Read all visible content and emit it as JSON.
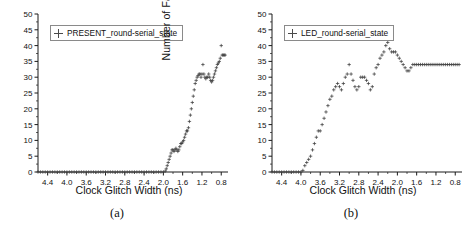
{
  "figure": {
    "panels": [
      {
        "id": "panel-a",
        "caption": "(a)",
        "legend_label": "PRESENT_round-serial_state",
        "legend_marker": "plus-icon"
      },
      {
        "id": "panel-b",
        "caption": "(b)",
        "legend_label": "LED_round-serial_state",
        "legend_marker": "plus-icon"
      }
    ]
  },
  "chart_data": [
    {
      "type": "scatter",
      "title": "",
      "xlabel": "Clock Glitch Width (ns)",
      "ylabel": "Number of Faulty Bits",
      "legend": [
        "PRESENT_round-serial_state"
      ],
      "legend_position": "top-left",
      "grid": false,
      "xlim": [
        4.6,
        0.66
      ],
      "ylim": [
        0,
        50
      ],
      "x_reversed": true,
      "xticks": [
        4.4,
        4.0,
        3.6,
        3.2,
        2.8,
        2.4,
        2.0,
        1.6,
        1.2,
        0.8
      ],
      "xtick_labels": [
        "4.4",
        "4.0",
        "3.6",
        "3.2",
        "2.8",
        "2.4",
        "2.0",
        "1.6",
        "1.2",
        "0.8"
      ],
      "yticks": [
        0,
        5,
        10,
        15,
        20,
        25,
        30,
        35,
        40,
        45,
        50
      ],
      "ytick_labels": [
        "0",
        "5",
        "10",
        "15",
        "20",
        "25",
        "30",
        "35",
        "40",
        "45",
        "50"
      ],
      "marker": "+",
      "color": "#3c3c3c",
      "x": [
        4.6,
        4.55,
        4.5,
        4.45,
        4.4,
        4.35,
        4.3,
        4.25,
        4.2,
        4.15,
        4.1,
        4.05,
        4.0,
        3.95,
        3.9,
        3.85,
        3.8,
        3.75,
        3.7,
        3.65,
        3.6,
        3.55,
        3.5,
        3.45,
        3.4,
        3.35,
        3.3,
        3.25,
        3.2,
        3.15,
        3.1,
        3.05,
        3.0,
        2.95,
        2.9,
        2.85,
        2.8,
        2.75,
        2.7,
        2.65,
        2.6,
        2.55,
        2.5,
        2.45,
        2.4,
        2.35,
        2.3,
        2.25,
        2.2,
        2.15,
        2.1,
        2.05,
        2.0,
        1.96,
        1.94,
        1.92,
        1.9,
        1.88,
        1.86,
        1.84,
        1.82,
        1.8,
        1.78,
        1.76,
        1.74,
        1.72,
        1.7,
        1.68,
        1.66,
        1.64,
        1.62,
        1.6,
        1.58,
        1.56,
        1.54,
        1.52,
        1.5,
        1.48,
        1.46,
        1.44,
        1.42,
        1.4,
        1.38,
        1.36,
        1.34,
        1.32,
        1.3,
        1.28,
        1.26,
        1.24,
        1.22,
        1.2,
        1.18,
        1.16,
        1.14,
        1.12,
        1.1,
        1.08,
        1.06,
        1.04,
        1.02,
        1.0,
        0.98,
        0.96,
        0.94,
        0.92,
        0.9,
        0.88,
        0.86,
        0.84,
        0.82,
        0.8,
        0.78,
        0.76,
        0.74,
        0.72
      ],
      "y": [
        0,
        0,
        0,
        0,
        0,
        0,
        0,
        0,
        0,
        0,
        0,
        0,
        0,
        0,
        0,
        0,
        0,
        0,
        0,
        0,
        0,
        0,
        0,
        0,
        0,
        0,
        0,
        0,
        0,
        0,
        0,
        0,
        0,
        0,
        0,
        0,
        0,
        0,
        0,
        0,
        0,
        0,
        0,
        0,
        0,
        0,
        0,
        0,
        0,
        0,
        0,
        0,
        0,
        0.3,
        1,
        2,
        3,
        4,
        5,
        6,
        7,
        7,
        6.5,
        7,
        7.5,
        7,
        6.5,
        7,
        8,
        9,
        9,
        9.5,
        10,
        11,
        12,
        13,
        13,
        14,
        16,
        18,
        20,
        22,
        24,
        26,
        28,
        29,
        30,
        30.5,
        31,
        31,
        30,
        31,
        34,
        31,
        30,
        29.5,
        30,
        30,
        31,
        30,
        29,
        28.5,
        29,
        30,
        31,
        32,
        33,
        34,
        34.5,
        35,
        36,
        40,
        37,
        37,
        37,
        37,
        37
      ],
      "annotation": "Faulty bits remain 0 until glitch width narrows to about 2.0 ns, then rise steeply to a plateau near 30-37 bits."
    },
    {
      "type": "scatter",
      "title": "",
      "xlabel": "Clock Glitch Width (ns)",
      "ylabel": "Number of Faulty Bits",
      "legend": [
        "LED_round-serial_state"
      ],
      "legend_position": "top-left",
      "grid": false,
      "xlim": [
        4.6,
        0.66
      ],
      "ylim": [
        0,
        50
      ],
      "x_reversed": true,
      "xticks": [
        4.4,
        4.0,
        3.6,
        3.2,
        2.8,
        2.4,
        2.0,
        1.6,
        1.2,
        0.8
      ],
      "xtick_labels": [
        "4.4",
        "4.0",
        "3.6",
        "3.2",
        "2.8",
        "2.4",
        "2.0",
        "1.6",
        "1.2",
        "0.8"
      ],
      "yticks": [
        0,
        5,
        10,
        15,
        20,
        25,
        30,
        35,
        40,
        45,
        50
      ],
      "ytick_labels": [
        "0",
        "5",
        "10",
        "15",
        "20",
        "25",
        "30",
        "35",
        "40",
        "45",
        "50"
      ],
      "marker": "+",
      "color": "#3c3c3c",
      "x": [
        4.6,
        4.55,
        4.5,
        4.45,
        4.4,
        4.35,
        4.3,
        4.25,
        4.2,
        4.15,
        4.1,
        4.05,
        4.0,
        3.96,
        3.92,
        3.88,
        3.84,
        3.8,
        3.76,
        3.72,
        3.68,
        3.64,
        3.6,
        3.56,
        3.52,
        3.48,
        3.44,
        3.4,
        3.36,
        3.32,
        3.28,
        3.24,
        3.2,
        3.16,
        3.12,
        3.08,
        3.04,
        3.0,
        2.96,
        2.92,
        2.88,
        2.84,
        2.8,
        2.76,
        2.72,
        2.68,
        2.64,
        2.6,
        2.56,
        2.52,
        2.48,
        2.44,
        2.4,
        2.36,
        2.32,
        2.28,
        2.24,
        2.2,
        2.16,
        2.12,
        2.08,
        2.04,
        2.0,
        1.96,
        1.92,
        1.88,
        1.84,
        1.8,
        1.76,
        1.72,
        1.68,
        1.64,
        1.6,
        1.56,
        1.52,
        1.48,
        1.44,
        1.4,
        1.36,
        1.32,
        1.28,
        1.24,
        1.2,
        1.16,
        1.12,
        1.08,
        1.04,
        1.0,
        0.96,
        0.92,
        0.88,
        0.84,
        0.8,
        0.76,
        0.72
      ],
      "y": [
        0,
        0,
        0,
        0,
        0,
        0,
        0,
        0,
        0,
        0,
        0,
        0,
        0,
        0.5,
        2,
        3,
        4,
        5,
        7,
        9,
        11,
        13,
        13,
        15,
        17,
        19,
        21,
        23,
        24,
        26,
        27,
        28,
        27,
        26,
        28,
        30,
        31,
        34,
        31,
        29,
        27,
        26,
        27,
        30,
        30,
        30,
        29,
        28,
        26,
        27,
        31,
        33,
        34,
        36,
        37,
        38,
        40,
        41,
        39,
        38,
        38,
        38,
        37,
        36,
        35,
        34,
        33,
        32,
        32,
        33,
        34,
        34,
        34,
        34,
        34,
        34,
        34,
        34,
        34,
        34,
        34,
        34,
        34,
        34,
        34,
        34,
        34,
        34,
        34,
        34,
        34,
        34,
        34,
        34,
        34
      ],
      "annotation": "Faulty bits rise from 0 at about 4.05 ns, climb with oscillation to a peak near 41 bits around 2.2 ns, dip to 32, then settle flat at 34 bits."
    }
  ]
}
